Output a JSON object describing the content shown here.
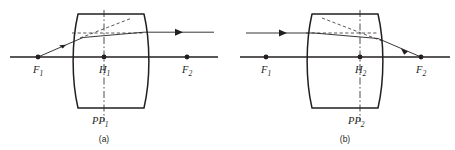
{
  "figure": {
    "background_color": "#ffffff",
    "ink_color": "#231f20",
    "panels": [
      {
        "id": "a",
        "caption": "(a)",
        "principal_plane_label": "PP",
        "principal_plane_subscript": "1",
        "principal_point_label": "H",
        "principal_point_subscript": "1",
        "front_focal_label": "F",
        "front_focal_subscript": "1",
        "back_focal_label": "F",
        "back_focal_subscript": "2",
        "description": "Ray from front focal point F1 emerges parallel to the optical axis",
        "lens": {
          "left_x": 78,
          "right_x": 144,
          "top_y": 14,
          "bottom_y": 108,
          "bulge": 7
        },
        "axis_y": 57,
        "principal_plane_x": 104,
        "front_focal_x": 38,
        "back_focal_x": 187,
        "ray_entry_y": 36,
        "ray_exit_y": 33,
        "incoming_arrow_direction": "right",
        "outgoing_arrow_direction": "right"
      },
      {
        "id": "b",
        "caption": "(b)",
        "principal_plane_label": "PP",
        "principal_plane_subscript": "2",
        "principal_point_label": "H",
        "principal_point_subscript": "2",
        "front_focal_label": "F",
        "front_focal_subscript": "1",
        "back_focal_label": "F",
        "back_focal_subscript": "2",
        "description": "Ray parallel to the optical axis converges through back focal point F2",
        "lens": {
          "left_x": 312,
          "right_x": 378,
          "top_y": 14,
          "bottom_y": 108,
          "bulge": 7
        },
        "axis_y": 57,
        "principal_plane_x": 360,
        "front_focal_x": 266,
        "back_focal_x": 421,
        "ray_entry_y": 33,
        "ray_exit_y": 36,
        "incoming_arrow_direction": "right",
        "outgoing_arrow_direction": "right"
      }
    ]
  }
}
